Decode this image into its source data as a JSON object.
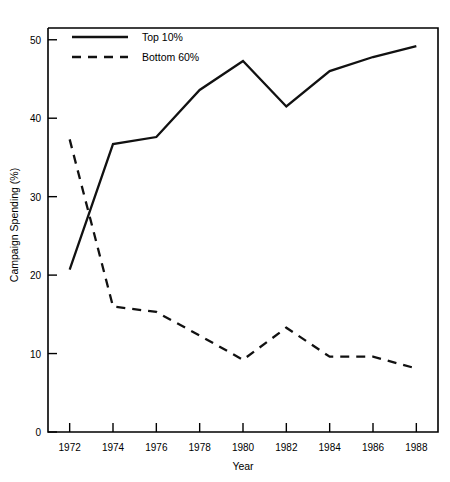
{
  "chart_data": {
    "type": "line",
    "title": "",
    "xlabel": "Year",
    "ylabel": "Campaign Spending (%)",
    "x": [
      1972,
      1974,
      1976,
      1978,
      1980,
      1982,
      1984,
      1986,
      1988
    ],
    "xticklabels": [
      "1972",
      "1974",
      "1976",
      "1978",
      "1980",
      "1982",
      "1984",
      "1986",
      "1988"
    ],
    "yticklabels": [
      "0",
      "10",
      "20",
      "30",
      "40",
      "50"
    ],
    "yticks": [
      0,
      10,
      20,
      30,
      40,
      50
    ],
    "xlim": [
      1971,
      1989
    ],
    "ylim": [
      0,
      51.5
    ],
    "grid": false,
    "legend_position": "top-left",
    "series": [
      {
        "name": "Top 10%",
        "style": "solid",
        "color": "#111111",
        "values": [
          20.7,
          36.7,
          37.6,
          43.6,
          47.3,
          41.5,
          46.0,
          47.8,
          49.2
        ]
      },
      {
        "name": "Bottom 60%",
        "style": "dashed",
        "color": "#111111",
        "values": [
          37.3,
          16.0,
          15.3,
          12.3,
          9.2,
          13.3,
          9.6,
          9.6,
          8.1
        ]
      }
    ]
  },
  "legend": {
    "entries": [
      {
        "label": "Top 10%"
      },
      {
        "label": "Bottom 60%"
      }
    ]
  },
  "axes": {
    "x_title": "Year",
    "y_title": "Campaign Spending (%)"
  }
}
